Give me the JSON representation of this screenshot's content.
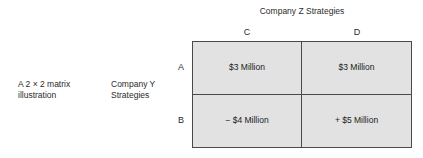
{
  "caption": {
    "illustration": "A 2 × 2 matrix\nillustration",
    "row_axis_label": "Company Y\nStrategies"
  },
  "matrix": {
    "column_axis_title": "Company Z Strategies",
    "column_headers": [
      {
        "id": "c",
        "label": "C"
      },
      {
        "id": "d",
        "label": "D"
      }
    ],
    "row_headers": [
      {
        "id": "a",
        "label": "A"
      },
      {
        "id": "b",
        "label": "B"
      }
    ],
    "cells": [
      {
        "row": "A",
        "column": "C",
        "value": "$3 Million"
      },
      {
        "row": "A",
        "column": "D",
        "value": "$3 Million"
      },
      {
        "row": "B",
        "column": "C",
        "value": "− $4 Million"
      },
      {
        "row": "B",
        "column": "D",
        "value": "+ $5 Million"
      }
    ],
    "colors": {
      "cell_fill": "#e2e2e2",
      "border": "#4a4a4a",
      "text": "#1a1a1a",
      "background": "#ffffff"
    }
  }
}
